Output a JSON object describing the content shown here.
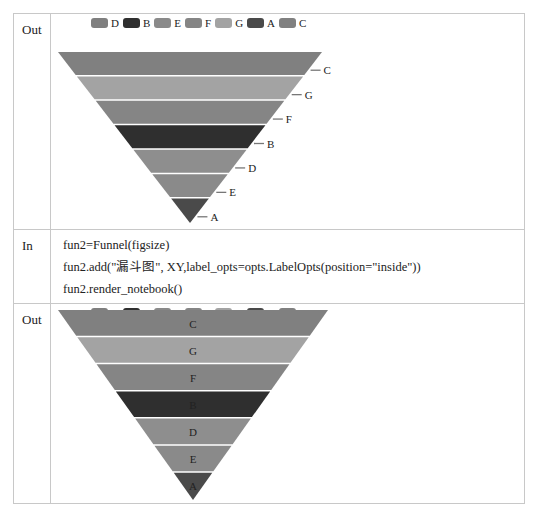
{
  "rows": [
    {
      "label": "Out",
      "type": "chart"
    },
    {
      "label": "In",
      "type": "code",
      "code": [
        "fun2=Funnel(figsize)",
        "fun2.add(\"漏斗图\", XY,label_opts=opts.LabelOpts(position=\"inside\"))",
        "fun2.render_notebook()"
      ]
    },
    {
      "label": "Out",
      "type": "chart"
    }
  ],
  "legend": [
    {
      "name": "D",
      "color": "#7f7f7f"
    },
    {
      "name": "B",
      "color": "#2f2f2f"
    },
    {
      "name": "E",
      "color": "#8a8a8a"
    },
    {
      "name": "F",
      "color": "#858585"
    },
    {
      "name": "G",
      "color": "#a3a3a3"
    },
    {
      "name": "A",
      "color": "#4a4a4a"
    },
    {
      "name": "C",
      "color": "#808080"
    }
  ],
  "chart_data": [
    {
      "type": "funnel",
      "title": "",
      "label_position": "outside",
      "order_top_to_bottom": [
        "C",
        "G",
        "F",
        "B",
        "D",
        "E",
        "A"
      ],
      "colors": {
        "C": "#808080",
        "G": "#a3a3a3",
        "F": "#858585",
        "B": "#2f2f2f",
        "D": "#8e8e8e",
        "E": "#8a8a8a",
        "A": "#4a4a4a"
      },
      "legend": [
        "D",
        "B",
        "E",
        "F",
        "G",
        "A",
        "C"
      ]
    },
    {
      "type": "funnel",
      "title": "漏斗图",
      "label_position": "inside",
      "order_top_to_bottom": [
        "C",
        "G",
        "F",
        "B",
        "D",
        "E",
        "A"
      ],
      "colors": {
        "C": "#808080",
        "G": "#a3a3a3",
        "F": "#858585",
        "B": "#2f2f2f",
        "D": "#8e8e8e",
        "E": "#8a8a8a",
        "A": "#4a4a4a"
      },
      "legend": [
        "D",
        "B",
        "E",
        "F",
        "G",
        "A",
        "C"
      ]
    }
  ]
}
